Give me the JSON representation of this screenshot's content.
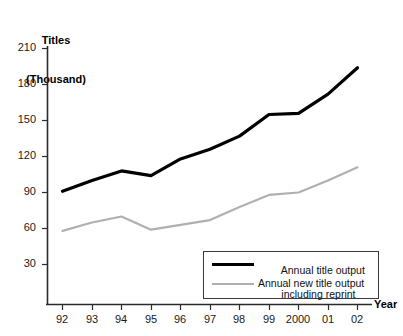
{
  "chart_data": {
    "type": "line",
    "title": "",
    "ylabel": "Titles\n(Thousand)",
    "ylabel_line1": "Titles",
    "ylabel_line2": "(Thousand)",
    "xlabel": "Year",
    "categories": [
      "92",
      "93",
      "94",
      "95",
      "96",
      "97",
      "98",
      "99",
      "2000",
      "01",
      "02"
    ],
    "yticks": [
      30,
      60,
      90,
      120,
      150,
      180,
      210
    ],
    "ylim": [
      0,
      210
    ],
    "grid": false,
    "legend_position": "inside-bottom-right",
    "series": [
      {
        "name": "Annual title output including reprint",
        "label_line1": "Annual title output",
        "label_line2": "including reprint",
        "color": "#000000",
        "width": 3,
        "values": [
          91,
          100,
          108,
          104,
          118,
          126,
          137,
          155,
          156,
          172,
          194
        ]
      },
      {
        "name": "Annual new title output",
        "label_line1": "Annual new title output",
        "label_line2": "",
        "color": "#b0b0b0",
        "width": 2,
        "values": [
          58,
          65,
          70,
          59,
          63,
          67,
          78,
          88,
          90,
          100,
          111
        ]
      }
    ]
  },
  "axes": {
    "y_title_line1": "Titles",
    "y_title_line2": "(Thousand)",
    "x_title": "Year",
    "y_tick_labels": [
      "210",
      "180",
      "150",
      "120",
      "90",
      "60",
      "30"
    ],
    "x_tick_labels": [
      "92",
      "93",
      "94",
      "95",
      "96",
      "97",
      "98",
      "99",
      "2000",
      "01",
      "02"
    ]
  },
  "legend": {
    "items": [
      {
        "line1": "Annual title output",
        "line2": "including reprint",
        "color": "#000000"
      },
      {
        "line1": "Annual new title output",
        "line2": "",
        "color": "#b0b0b0"
      }
    ]
  }
}
